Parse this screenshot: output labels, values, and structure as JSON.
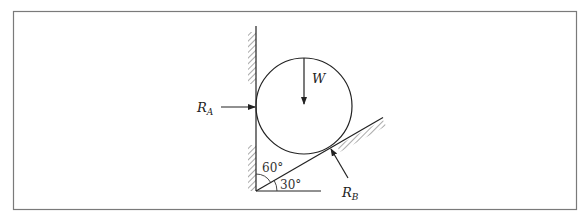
{
  "diagram": {
    "title": "",
    "colors": {
      "frame": "#7a7a7a",
      "ink": "#222222",
      "hatch": "#555555",
      "background": "#ffffff"
    },
    "labels": {
      "weight": "W",
      "reaction_a": {
        "main": "R",
        "sub": "A"
      },
      "reaction_b": {
        "main": "R",
        "sub": "B"
      },
      "angle_wall": "60°",
      "angle_incline": "30°"
    },
    "elements": {
      "vertical_wall": "hatched vertical wall (left)",
      "inclined_plane": "hatched inclined plane at 30° to horizontal",
      "sphere": "circle resting between wall and incline",
      "arrows": [
        "W downward from top of circle to center",
        "R_A horizontal into wall contact point",
        "R_B normal to incline at contact point"
      ]
    }
  }
}
